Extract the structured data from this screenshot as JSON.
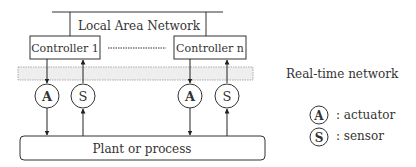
{
  "diagram": {
    "lan_label": "Local Area Network",
    "controllers": [
      {
        "label": "Controller 1"
      },
      {
        "label": "Controller n"
      }
    ],
    "actuator_symbol": "A",
    "sensor_symbol": "S",
    "plant_label": "Plant or process",
    "realtime_network_label": "Real-time network"
  },
  "legend": {
    "items": [
      {
        "symbol": "A",
        "label": ": actuator"
      },
      {
        "symbol": "S",
        "label": ": sensor"
      }
    ]
  },
  "colors": {
    "stroke": "#333333",
    "band_fill": "#eeeeee",
    "band_stroke": "#999999"
  }
}
